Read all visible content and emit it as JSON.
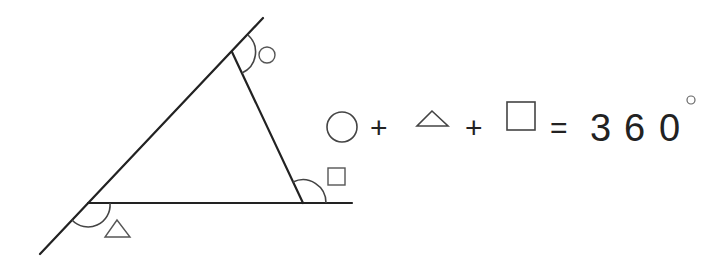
{
  "diagram": {
    "angle_markers": [
      {
        "id": "top",
        "symbol": "circle"
      },
      {
        "id": "bottom-left",
        "symbol": "triangle"
      },
      {
        "id": "bottom-right",
        "symbol": "square"
      }
    ],
    "equation": {
      "terms": [
        "circle",
        "triangle",
        "square"
      ],
      "plus": "+",
      "equals": "=",
      "digits": [
        "3",
        "6",
        "0"
      ],
      "degree": "°"
    },
    "colors": {
      "line": "#222222",
      "symbol": "#555555"
    }
  }
}
